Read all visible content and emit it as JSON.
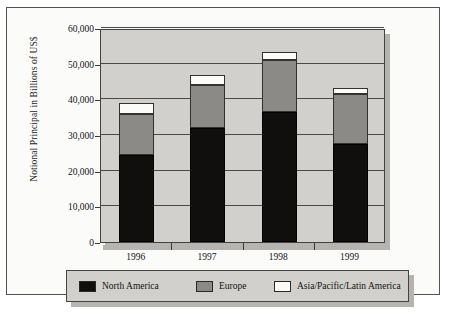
{
  "chart_data": {
    "type": "bar",
    "subtype": "stacked-bar",
    "title": "",
    "xlabel": "",
    "ylabel": "Notional Principal in Billions of US$",
    "categories": [
      "1996",
      "1997",
      "1998",
      "1999"
    ],
    "ylim": [
      0,
      60000
    ],
    "yticks": [
      0,
      10000,
      20000,
      30000,
      40000,
      50000,
      60000
    ],
    "ytick_labels": [
      "0",
      "10,000",
      "20,000",
      "30,000",
      "40,000",
      "50,000",
      "60,000"
    ],
    "grid": true,
    "legend_position": "bottom",
    "series": [
      {
        "name": "North America",
        "color": "#100f0e",
        "values": [
          24500,
          32000,
          36500,
          27500
        ]
      },
      {
        "name": "Europe",
        "color": "#8b8a87",
        "values": [
          11500,
          12000,
          14500,
          14000
        ]
      },
      {
        "name": "Asia/Pacific/Latin America",
        "color": "#fbfbf9",
        "values": [
          3000,
          2700,
          2300,
          1800
        ]
      }
    ],
    "totals": [
      39000,
      46700,
      53300,
      43300
    ]
  },
  "axes": {
    "y_title": "Notional Principal in Billions of US$"
  },
  "legend": {
    "items": [
      {
        "label": "North America",
        "swatch": "black-swatch"
      },
      {
        "label": "Europe",
        "swatch": "gray-swatch"
      },
      {
        "label": "Asia/Pacific/Latin America",
        "swatch": "white-swatch"
      }
    ]
  },
  "colors": {
    "north_america": "#100f0e",
    "europe": "#8b8a87",
    "asia_pacific_latin_america": "#fbfbf9",
    "plot_background": "#d2d0cc",
    "page_background": "#fbfbfa",
    "axis": "#44423f"
  }
}
